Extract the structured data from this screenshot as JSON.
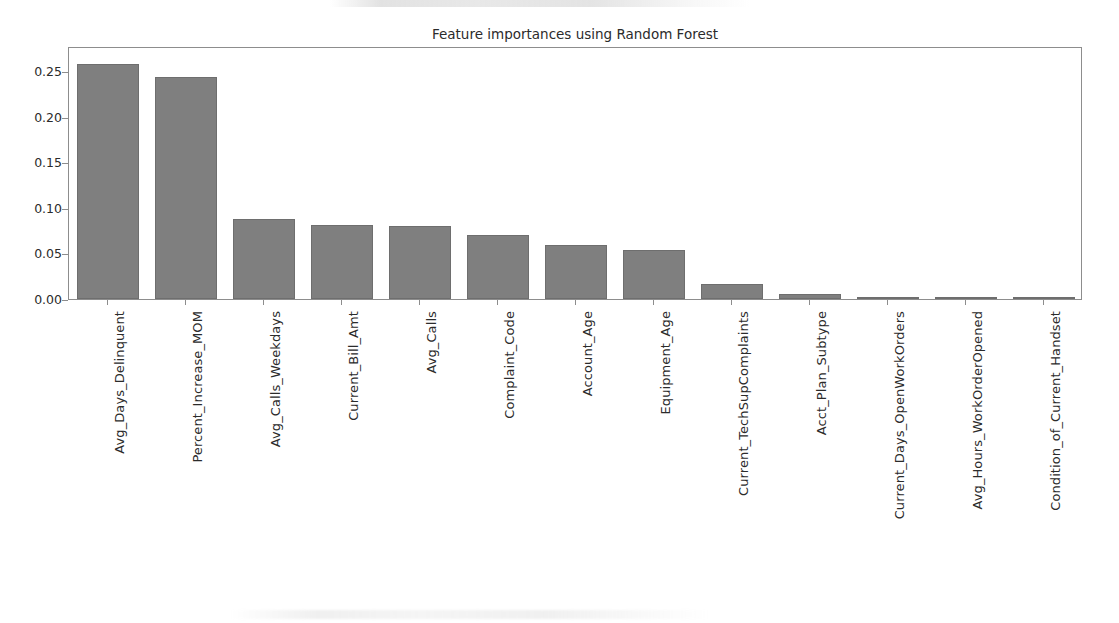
{
  "chart_data": {
    "type": "bar",
    "title": "Feature importances using Random Forest",
    "xlabel": "",
    "ylabel": "",
    "ylim": [
      0.0,
      0.2775
    ],
    "yticks": [
      "0.00",
      "0.05",
      "0.10",
      "0.15",
      "0.20",
      "0.25"
    ],
    "ytick_values": [
      0.0,
      0.05,
      0.1,
      0.15,
      0.2,
      0.25
    ],
    "grid": false,
    "legend": null,
    "bar_color": "#7f7f7f",
    "categories": [
      "Avg_Days_Delinquent",
      "Percent_Increase_MOM",
      "Avg_Calls_Weekdays",
      "Current_Bill_Amt",
      "Avg_Calls",
      "Complaint_Code",
      "Account_Age",
      "Equipment_Age",
      "Current_TechSupComplaints",
      "Acct_Plan_Subtype",
      "Current_Days_OpenWorkOrders",
      "Avg_Hours_WorkOrderOpened",
      "Condition_of_Current_Handset"
    ],
    "values": [
      0.258,
      0.243,
      0.088,
      0.081,
      0.08,
      0.07,
      0.059,
      0.054,
      0.017,
      0.005,
      0.0022,
      0.0015,
      0.0006
    ]
  }
}
